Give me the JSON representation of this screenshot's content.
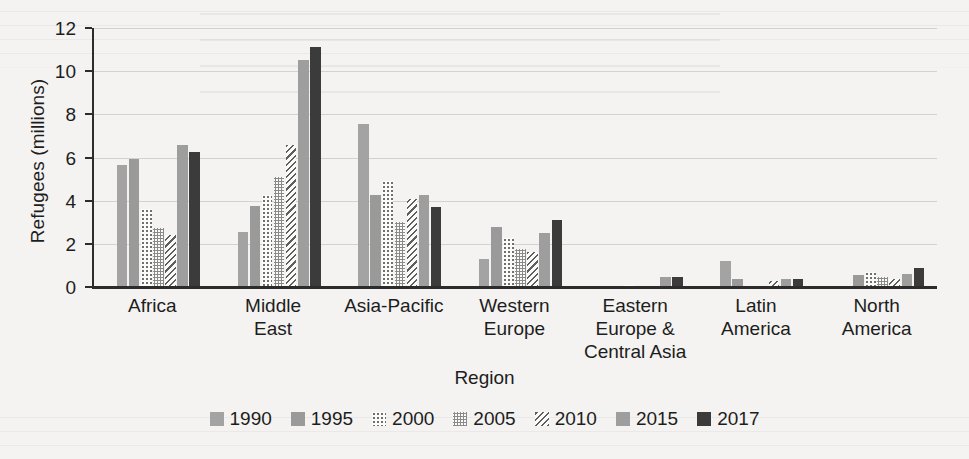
{
  "chart_data": {
    "type": "bar",
    "title": "",
    "xlabel": "Region",
    "ylabel": "Refugees (millions)",
    "ylim": [
      0,
      12
    ],
    "yticks": [
      0,
      2,
      4,
      6,
      8,
      10,
      12
    ],
    "grid": true,
    "legend_position": "bottom",
    "categories": [
      "Africa",
      "Middle East",
      "Asia-Pacific",
      "Western Europe",
      "Eastern Europe & Central Asia",
      "Latin America",
      "North America"
    ],
    "category_lines": [
      [
        "Africa"
      ],
      [
        "Middle",
        "East"
      ],
      [
        "Asia-Pacific"
      ],
      [
        "Western",
        "Europe"
      ],
      [
        "Eastern",
        "Europe &",
        "Central Asia"
      ],
      [
        "Latin",
        "America"
      ],
      [
        "North",
        "America"
      ]
    ],
    "series": [
      {
        "name": "1990",
        "pattern": "solid-light-gray",
        "color": "#a3a3a3",
        "values": [
          5.65,
          2.55,
          7.55,
          1.3,
          0.0,
          1.2,
          0.0
        ]
      },
      {
        "name": "1995",
        "pattern": "solid-gray",
        "color": "#9a9a9a",
        "values": [
          5.95,
          3.75,
          4.25,
          2.8,
          0.05,
          0.35,
          0.55
        ]
      },
      {
        "name": "2000",
        "pattern": "dotted",
        "color": "#6f6f6f",
        "values": [
          3.6,
          4.25,
          4.9,
          2.25,
          0.1,
          0.0,
          0.7
        ]
      },
      {
        "name": "2005",
        "pattern": "checkered",
        "color": "#8a8a8a",
        "values": [
          2.75,
          5.1,
          3.0,
          1.75,
          0.05,
          0.0,
          0.45
        ]
      },
      {
        "name": "2010",
        "pattern": "diagonal-stripes",
        "color": "#5f5f5f",
        "values": [
          2.4,
          6.6,
          4.1,
          1.6,
          0.0,
          0.3,
          0.35
        ]
      },
      {
        "name": "2015",
        "pattern": "solid-medium-gray",
        "color": "#9e9e9e",
        "values": [
          6.6,
          10.5,
          4.25,
          2.5,
          0.45,
          0.35,
          0.6
        ]
      },
      {
        "name": "2017",
        "pattern": "solid-dark",
        "color": "#3b3b3b",
        "values": [
          6.25,
          11.1,
          3.7,
          3.1,
          0.45,
          0.35,
          0.9
        ]
      }
    ]
  },
  "axis": {
    "y_title": "Refugees (millions)",
    "x_title": "Region",
    "y_tick_labels": [
      "12",
      "10",
      "8",
      "6",
      "4",
      "2",
      "0"
    ]
  },
  "legend": {
    "items": [
      {
        "label": "1990",
        "swatch": "solid-light-gray-swatch"
      },
      {
        "label": "1995",
        "swatch": "solid-gray-swatch"
      },
      {
        "label": "2000",
        "swatch": "dotted-swatch"
      },
      {
        "label": "2005",
        "swatch": "checkered-swatch"
      },
      {
        "label": "2010",
        "swatch": "diagonal-stripes-swatch"
      },
      {
        "label": "2015",
        "swatch": "solid-medium-gray-swatch"
      },
      {
        "label": "2017",
        "swatch": "solid-dark-swatch"
      }
    ]
  }
}
